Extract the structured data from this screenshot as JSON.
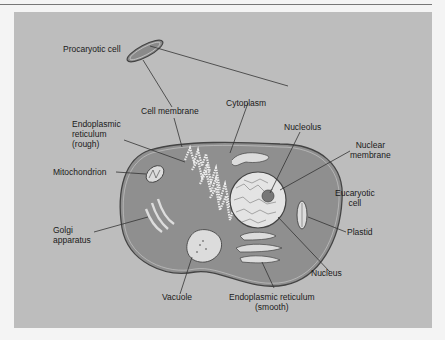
{
  "diagram": {
    "labels": {
      "procaryotic_cell": "Procaryotic cell",
      "cell_membrane": "Cell membrane",
      "cytoplasm": "Cytoplasm",
      "er_rough_1": "Endoplasmic",
      "er_rough_2": "reticulum",
      "er_rough_3": "(rough)",
      "mitochondrion": "Mitochondrion",
      "nucleolus": "Nucleolus",
      "nuclear_membrane_1": "Nuclear",
      "nuclear_membrane_2": "membrane",
      "eucaryotic_cell_1": "Eucaryotic",
      "eucaryotic_cell_2": "cell",
      "golgi_1": "Golgi",
      "golgi_2": "apparatus",
      "plastid": "Plastid",
      "nucleus": "Nucleus",
      "vacuole": "Vacuole",
      "er_smooth_1": "Endoplasmic reticulum",
      "er_smooth_2": "(smooth)"
    },
    "colors": {
      "background": "#bdbdbd",
      "cell_fill": "#8f8f8f",
      "organelle_fill": "#dcdcdc",
      "line": "#333333"
    }
  }
}
